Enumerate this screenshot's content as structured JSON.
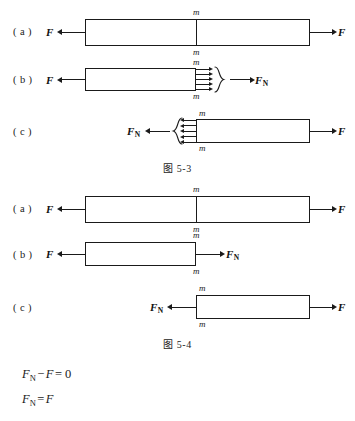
{
  "figures": [
    {
      "caption": "图 5-3",
      "panels": [
        {
          "label": "( a )",
          "left_force": "F",
          "right_force": "F",
          "m_top": "m",
          "m_bottom": "m"
        },
        {
          "label": "( b )",
          "left_force": "F",
          "resultant_force": "F",
          "resultant_sub": "N",
          "m_top": "m",
          "m_bottom": "m",
          "distributed_arrow_count": 5,
          "brace_direction": "right"
        },
        {
          "label": "( c )",
          "resultant_force": "F",
          "resultant_sub": "N",
          "right_force": "F",
          "m_top": "m",
          "m_bottom": "m",
          "distributed_arrow_count": 5,
          "brace_direction": "left"
        }
      ]
    },
    {
      "caption": "图 5-4",
      "panels": [
        {
          "label": "( a )",
          "left_force": "F",
          "right_force": "F",
          "m_top": "m",
          "m_bottom": "m"
        },
        {
          "label": "( b )",
          "left_force": "F",
          "resultant_force": "F",
          "resultant_sub": "N",
          "m_top": "m",
          "m_bottom": "m"
        },
        {
          "label": "( c )",
          "resultant_force": "F",
          "resultant_sub": "N",
          "right_force": "F",
          "m_top": "m",
          "m_bottom": "m"
        }
      ]
    }
  ],
  "equations": [
    {
      "lhs": "F",
      "lhs_sub": "N",
      "op1": "−",
      "term2": "F",
      "op2": "=",
      "rhs": "0"
    },
    {
      "lhs": "F",
      "lhs_sub": "N",
      "op2": "=",
      "rhs": "F"
    }
  ],
  "colors": {
    "ink": "#1a1a1a",
    "background": "#ffffff"
  }
}
